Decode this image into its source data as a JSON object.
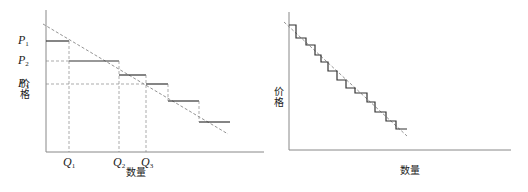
{
  "left_panel": {
    "y_axis_label": "价格",
    "x_axis_label": "数量",
    "price_labels": [
      {
        "base": "P",
        "sub": "1"
      },
      {
        "base": "P",
        "sub": "2"
      },
      {
        "base": "P",
        "sub": "3"
      }
    ],
    "quantity_labels": [
      {
        "base": "Q",
        "sub": "1"
      },
      {
        "base": "Q",
        "sub": "2"
      },
      {
        "base": "Q",
        "sub": "3"
      }
    ]
  },
  "right_panel": {
    "y_axis_label": "价格",
    "x_axis_label": "数量"
  },
  "colors": {
    "axis": "#888888",
    "step": "#333333",
    "dashed": "#777777"
  }
}
